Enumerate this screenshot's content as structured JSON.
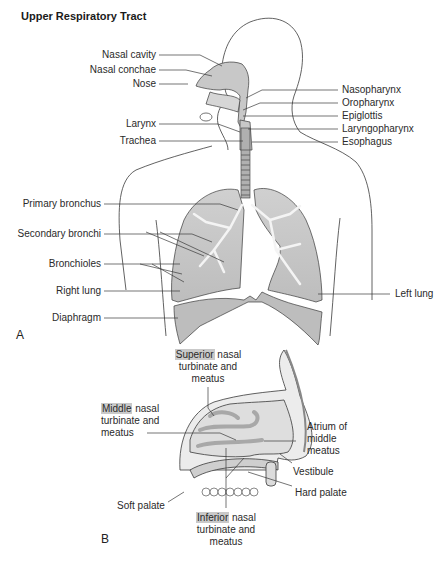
{
  "title": "Upper Respiratory Tract",
  "panel_a": {
    "letter": "A",
    "labels_left": [
      {
        "id": "nasal-cavity",
        "text": "Nasal cavity"
      },
      {
        "id": "nasal-conchae",
        "text": "Nasal conchae"
      },
      {
        "id": "nose",
        "text": "Nose"
      },
      {
        "id": "larynx",
        "text": "Larynx"
      },
      {
        "id": "trachea",
        "text": "Trachea"
      },
      {
        "id": "primary-bronchus",
        "text": "Primary bronchus"
      },
      {
        "id": "secondary-bronchi",
        "text": "Secondary bronchi"
      },
      {
        "id": "bronchioles",
        "text": "Bronchioles"
      },
      {
        "id": "right-lung",
        "text": "Right lung"
      },
      {
        "id": "diaphragm",
        "text": "Diaphragm"
      }
    ],
    "labels_right": [
      {
        "id": "nasopharynx",
        "text": "Nasopharynx"
      },
      {
        "id": "oropharynx",
        "text": "Oropharynx"
      },
      {
        "id": "epiglottis",
        "text": "Epiglottis"
      },
      {
        "id": "laryngopharynx",
        "text": "Laryngopharynx"
      },
      {
        "id": "esophagus",
        "text": "Esophagus"
      },
      {
        "id": "left-lung",
        "text": "Left lung"
      }
    ]
  },
  "panel_b": {
    "letter": "B",
    "superior": {
      "highlight": "Superior",
      "rest1": " nasal",
      "line2": "turbinate and",
      "line3": "meatus"
    },
    "middle": {
      "highlight": "Middle",
      "rest1": " nasal",
      "line2": "turbinate and",
      "line3": "meatus"
    },
    "inferior": {
      "highlight": "Inferior",
      "rest1": " nasal",
      "line2": "turbinate and",
      "line3": "meatus"
    },
    "atrium": {
      "line1": "Atrium of",
      "line2": "middle",
      "line3": "meatus"
    },
    "vestibule": "Vestibule",
    "hard_palate": "Hard palate",
    "soft_palate": "Soft palate"
  },
  "colors": {
    "organ_fill": "#c8c8c8",
    "outline": "#3a3a3a",
    "highlight": "#c9c9c9"
  }
}
